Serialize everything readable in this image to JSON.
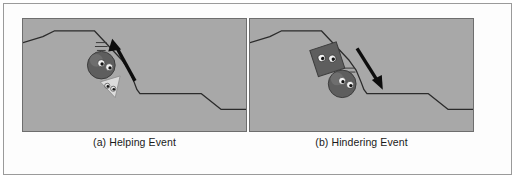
{
  "figure": {
    "background_color": "#fdfdfd",
    "frame_border_color": "#9a9a9a",
    "scene_fill": "#a8a8a8",
    "scene_border_color": "#6e6e6e",
    "terrain_line_color": "#2b2b2b",
    "arrow_color": "#0d0d0d",
    "circle_fill": "#5e5e5e",
    "square_fill": "#5e5e5e",
    "triangle_fill": "#dcdcdc",
    "eye_light": "#f2f2f2",
    "eye_dark": "#1a1a1a"
  },
  "panels": [
    {
      "id": "a",
      "caption": "(a) Helping Event",
      "scene_label": "helping-event-scene",
      "characters": [
        {
          "name": "climber-circle",
          "shape": "circle",
          "role": "climber"
        },
        {
          "name": "helper-triangle",
          "shape": "triangle",
          "role": "helper"
        }
      ],
      "arrow": {
        "name": "upward-motion-arrow",
        "direction": "up-right"
      }
    },
    {
      "id": "b",
      "caption": "(b) Hindering Event",
      "scene_label": "hindering-event-scene",
      "characters": [
        {
          "name": "hinderer-square",
          "shape": "square",
          "role": "hinderer"
        },
        {
          "name": "climber-circle",
          "shape": "circle",
          "role": "climber"
        }
      ],
      "arrow": {
        "name": "downward-motion-arrow",
        "direction": "down-right"
      }
    }
  ]
}
